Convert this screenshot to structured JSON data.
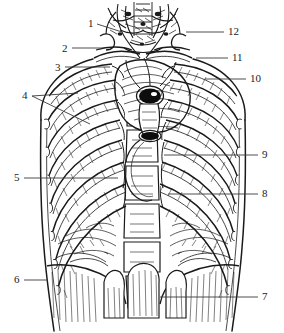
{
  "figure": {
    "kind": "anatomical-line-drawing",
    "style": "black-and-white engraved hatch illustration",
    "background_color": "#ffffff",
    "ink_color": "#1a1a1a",
    "width": 284,
    "height": 333
  },
  "labels": [
    {
      "id": "1",
      "text": "1",
      "side": "left",
      "x": 88,
      "y": 18,
      "leader": [
        [
          97,
          24
        ],
        [
          122,
          32
        ]
      ]
    },
    {
      "id": "2",
      "text": "2",
      "side": "left",
      "x": 62,
      "y": 43,
      "leader": [
        [
          72,
          48
        ],
        [
          104,
          48
        ]
      ]
    },
    {
      "id": "3",
      "text": "3",
      "side": "left",
      "x": 55,
      "y": 62,
      "leader": [
        [
          65,
          67
        ],
        [
          110,
          67
        ]
      ]
    },
    {
      "id": "4",
      "text": "4",
      "side": "left",
      "x": 22,
      "y": 90,
      "leader": [
        [
          32,
          96
        ],
        [
          78,
          93
        ]
      ],
      "leader2": [
        [
          32,
          96
        ],
        [
          90,
          124
        ]
      ]
    },
    {
      "id": "5",
      "text": "5",
      "side": "left",
      "x": 14,
      "y": 172,
      "leader": [
        [
          24,
          178
        ],
        [
          118,
          178
        ]
      ]
    },
    {
      "id": "6",
      "text": "6",
      "side": "left",
      "x": 14,
      "y": 274,
      "leader": [
        [
          24,
          280
        ],
        [
          48,
          280
        ]
      ]
    },
    {
      "id": "7",
      "text": "7",
      "side": "right",
      "x": 262,
      "y": 291,
      "leader": [
        [
          258,
          297
        ],
        [
          160,
          297
        ]
      ]
    },
    {
      "id": "8",
      "text": "8",
      "side": "right",
      "x": 262,
      "y": 188,
      "leader": [
        [
          258,
          194
        ],
        [
          168,
          194
        ]
      ]
    },
    {
      "id": "9",
      "text": "9",
      "side": "right",
      "x": 262,
      "y": 149,
      "leader": [
        [
          258,
          155
        ],
        [
          164,
          155
        ]
      ]
    },
    {
      "id": "10",
      "text": "10",
      "side": "right",
      "x": 250,
      "y": 73,
      "leader": [
        [
          246,
          79
        ],
        [
          205,
          79
        ]
      ]
    },
    {
      "id": "11",
      "text": "11",
      "side": "right",
      "x": 232,
      "y": 52,
      "leader": [
        [
          228,
          58
        ],
        [
          196,
          58
        ]
      ]
    },
    {
      "id": "12",
      "text": "12",
      "side": "right",
      "x": 228,
      "y": 26,
      "leader": [
        [
          224,
          32
        ],
        [
          186,
          32
        ]
      ]
    }
  ]
}
